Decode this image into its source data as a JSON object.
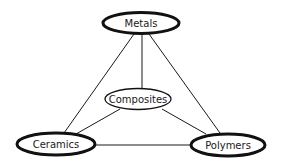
{
  "diagram": {
    "nodes": [
      {
        "id": "metals",
        "label": "Metals",
        "cx": 141,
        "cy": 23,
        "rx": 39,
        "ry": 11,
        "stroke": 3
      },
      {
        "id": "composites",
        "label": "Composites",
        "cx": 138,
        "cy": 99,
        "rx": 33,
        "ry": 10.5,
        "stroke": 1.3
      },
      {
        "id": "ceramics",
        "label": "Ceramics",
        "cx": 56,
        "cy": 144,
        "rx": 40,
        "ry": 11.5,
        "stroke": 3
      },
      {
        "id": "polymers",
        "label": "Polymers",
        "cx": 228,
        "cy": 145,
        "rx": 38,
        "ry": 11.5,
        "stroke": 3
      }
    ],
    "edges": [
      {
        "from": "metals",
        "to": "ceramics"
      },
      {
        "from": "metals",
        "to": "composites"
      },
      {
        "from": "metals",
        "to": "polymers"
      },
      {
        "from": "composites",
        "to": "ceramics"
      },
      {
        "from": "composites",
        "to": "polymers"
      },
      {
        "from": "ceramics",
        "to": "polymers"
      }
    ]
  }
}
